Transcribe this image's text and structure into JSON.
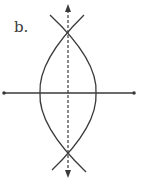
{
  "figure": {
    "label": "b.",
    "colors": {
      "stroke": "#3a3a3a",
      "background": "#ffffff"
    }
  },
  "segment": {
    "x1": 4,
    "y1": 93,
    "x2": 134,
    "y2": 93
  },
  "bisector": {
    "x": 68,
    "y_top": 4,
    "y_bottom": 178,
    "style": "dashed",
    "arrows": "both"
  },
  "arcs": [
    {
      "name": "left-arc",
      "path": "M 84 15 Q 38 60 40 93 Q 38 126 86 172"
    },
    {
      "name": "right-arc",
      "path": "M 50 15 Q 98 60 96 93 Q 98 126 52 170"
    }
  ],
  "intersections": [
    {
      "x": 68,
      "y": 29
    },
    {
      "x": 68,
      "y": 159
    }
  ]
}
